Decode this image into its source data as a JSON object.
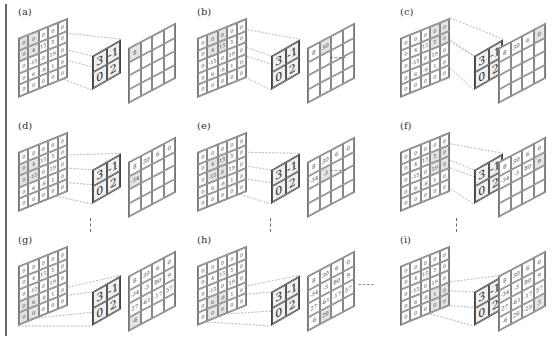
{
  "figure": {
    "type": "convolution-stride-illustration",
    "kernel": [
      [
        3,
        -1
      ],
      [
        0,
        2
      ]
    ],
    "input": [
      [
        0,
        0,
        0,
        0,
        0
      ],
      [
        0,
        4,
        15,
        5,
        0
      ],
      [
        0,
        -15,
        0,
        19,
        0
      ],
      [
        0,
        6,
        -8,
        1,
        0
      ],
      [
        0,
        0,
        0,
        0,
        0
      ]
    ],
    "output_full": [
      [
        "8",
        "30",
        "6",
        "0"
      ],
      [
        "-34",
        "-3",
        "80",
        "9"
      ],
      [
        "27",
        "-61",
        "-17",
        "57"
      ],
      [
        "-6",
        "26",
        "-25",
        "3"
      ]
    ],
    "separators": {
      "horizontal": "----",
      "vertical": "⋮"
    }
  },
  "panels": [
    {
      "label": "(a)",
      "pos": [
        0,
        0
      ],
      "filled": 1
    },
    {
      "label": "(b)",
      "pos": [
        0,
        1
      ],
      "filled": 2
    },
    {
      "label": "(c)",
      "pos": [
        0,
        3
      ],
      "filled": 4
    },
    {
      "label": "(d)",
      "pos": [
        1,
        0
      ],
      "filled": 5
    },
    {
      "label": "(e)",
      "pos": [
        1,
        1
      ],
      "filled": 6
    },
    {
      "label": "(f)",
      "pos": [
        1,
        3
      ],
      "filled": 8
    },
    {
      "label": "(g)",
      "pos": [
        3,
        0
      ],
      "filled": 13
    },
    {
      "label": "(h)",
      "pos": [
        3,
        1
      ],
      "filled": 14
    },
    {
      "label": "(i)",
      "pos": [
        3,
        3
      ],
      "filled": 16
    }
  ]
}
